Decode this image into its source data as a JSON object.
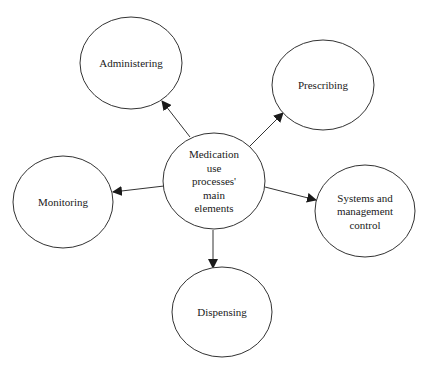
{
  "diagram": {
    "center": {
      "lines": [
        "Medication",
        "use",
        "processes'",
        "main",
        "elements"
      ],
      "cx": 214,
      "cy": 181,
      "rx": 51,
      "ry": 48
    },
    "nodes": [
      {
        "id": "administering",
        "lines": [
          "Administering"
        ],
        "cx": 131,
        "cy": 63,
        "rx": 51,
        "ry": 46
      },
      {
        "id": "prescribing",
        "lines": [
          "Prescribing"
        ],
        "cx": 323,
        "cy": 85,
        "rx": 51,
        "ry": 45
      },
      {
        "id": "monitoring",
        "lines": [
          "Monitoring"
        ],
        "cx": 63,
        "cy": 202,
        "rx": 50,
        "ry": 46
      },
      {
        "id": "systems",
        "lines": [
          "Systems and",
          "management",
          "control"
        ],
        "cx": 365,
        "cy": 211,
        "rx": 50,
        "ry": 46
      },
      {
        "id": "dispensing",
        "lines": [
          "Dispensing"
        ],
        "cx": 222,
        "cy": 312,
        "rx": 50,
        "ry": 45
      }
    ],
    "edges": [
      {
        "from": "center",
        "to": "administering",
        "x1": 190,
        "y1": 137,
        "x2": 162,
        "y2": 101
      },
      {
        "from": "center",
        "to": "prescribing",
        "x1": 249,
        "y1": 147,
        "x2": 283,
        "y2": 113
      },
      {
        "from": "center",
        "to": "monitoring",
        "x1": 164,
        "y1": 186,
        "x2": 113,
        "y2": 192
      },
      {
        "from": "center",
        "to": "systems",
        "x1": 265,
        "y1": 187,
        "x2": 316,
        "y2": 200
      },
      {
        "from": "center",
        "to": "dispensing",
        "x1": 213,
        "y1": 230,
        "x2": 213,
        "y2": 268
      }
    ],
    "colors": {
      "stroke": "#333333",
      "text": "#1a1a1a",
      "background": "#ffffff"
    }
  }
}
